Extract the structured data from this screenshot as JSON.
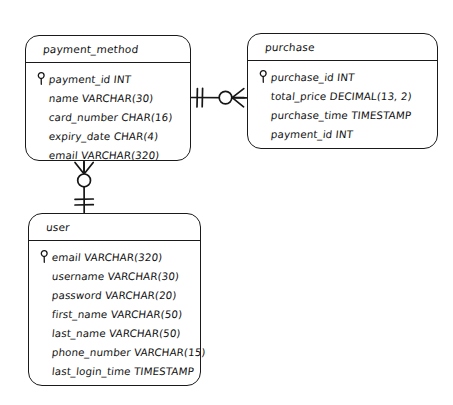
{
  "diagram": {
    "style": "hand-drawn",
    "background_color": "#ffffff",
    "ink_color": "#111111"
  },
  "entities": [
    {
      "id": "payment_method",
      "name": "payment_method",
      "attributes": [
        {
          "label": "payment_id INT",
          "key": true,
          "key_icon": "key-icon"
        },
        {
          "label": "name VARCHAR(30)",
          "key": false
        },
        {
          "label": "card_number CHAR(16)",
          "key": false
        },
        {
          "label": "expiry_date CHAR(4)",
          "key": false
        },
        {
          "label": "email VARCHAR(320)",
          "key": false
        }
      ]
    },
    {
      "id": "purchase",
      "name": "purchase",
      "attributes": [
        {
          "label": "purchase_id INT",
          "key": true,
          "key_icon": "key-icon"
        },
        {
          "label": "total_price DECIMAL(13, 2)",
          "key": false
        },
        {
          "label": "purchase_time TIMESTAMP",
          "key": false
        },
        {
          "label": "payment_id INT",
          "key": false
        }
      ]
    },
    {
      "id": "user",
      "name": "user",
      "attributes": [
        {
          "label": "email VARCHAR(320)",
          "key": true,
          "key_icon": "key-icon"
        },
        {
          "label": "username VARCHAR(30)",
          "key": false
        },
        {
          "label": "password VARCHAR(20)",
          "key": false
        },
        {
          "label": "first_name VARCHAR(50)",
          "key": false
        },
        {
          "label": "last_name VARCHAR(50)",
          "key": false
        },
        {
          "label": "phone_number VARCHAR(15)",
          "key": false
        },
        {
          "label": "last_login_time TIMESTAMP",
          "key": false
        }
      ]
    }
  ],
  "relationships": [
    {
      "id": "payment_method-purchase",
      "from": "payment_method",
      "to": "purchase",
      "from_cardinality": "one",
      "to_cardinality": "zero-or-many",
      "from_notation": "double-tick-icon",
      "to_notation": "crows-foot-circle-icon",
      "orientation": "horizontal"
    },
    {
      "id": "user-payment_method",
      "from": "payment_method",
      "to": "user",
      "from_cardinality": "zero-or-many",
      "to_cardinality": "one",
      "from_notation": "crows-foot-circle-icon",
      "to_notation": "double-tick-icon",
      "orientation": "vertical"
    }
  ]
}
